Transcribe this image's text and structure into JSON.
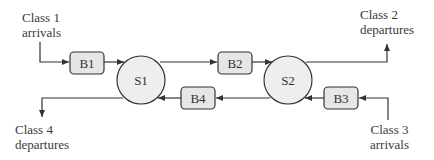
{
  "diagram": {
    "buffers": [
      {
        "id": "B1",
        "label": "B1"
      },
      {
        "id": "B2",
        "label": "B2"
      },
      {
        "id": "B3",
        "label": "B3"
      },
      {
        "id": "B4",
        "label": "B4"
      }
    ],
    "servers": [
      {
        "id": "S1",
        "label": "S1"
      },
      {
        "id": "S2",
        "label": "S2"
      }
    ],
    "labels": {
      "class1": {
        "line1": "Class 1",
        "line2": "arrivals"
      },
      "class2": {
        "line1": "Class 2",
        "line2": "departures"
      },
      "class3": {
        "line1": "Class 3",
        "line2": "arrivals"
      },
      "class4": {
        "line1": "Class 4",
        "line2": "departures"
      }
    },
    "colors": {
      "stroke": "#333333",
      "buffer_fill": "#e6e6e6",
      "server_fill": "#eeeeee"
    }
  }
}
